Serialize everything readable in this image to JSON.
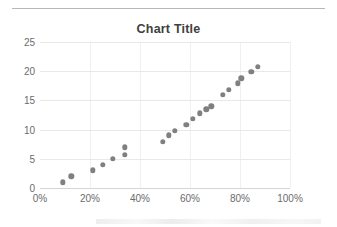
{
  "chart_data": {
    "type": "scatter",
    "title": "Chart Title",
    "xlabel": "",
    "ylabel": "",
    "xlim": [
      0,
      100
    ],
    "ylim": [
      0,
      25
    ],
    "x_tick_labels": [
      "0%",
      "20%",
      "40%",
      "60%",
      "80%",
      "100%"
    ],
    "x_tick_values": [
      0,
      20,
      40,
      60,
      80,
      100
    ],
    "y_tick_labels": [
      "0",
      "5",
      "10",
      "15",
      "20",
      "25"
    ],
    "y_tick_values": [
      0,
      5,
      10,
      15,
      20,
      25
    ],
    "grid": "horizontal",
    "legend": "none",
    "marker_color": "#808080",
    "series": [
      {
        "name": "Series 1",
        "points": [
          [
            9,
            1
          ],
          [
            12.5,
            2
          ],
          [
            21,
            3
          ],
          [
            25,
            4
          ],
          [
            29,
            5
          ],
          [
            34,
            5.7
          ],
          [
            34,
            7
          ],
          [
            49,
            7.9
          ],
          [
            51.5,
            9
          ],
          [
            54,
            9.8
          ],
          [
            58.5,
            10.8
          ],
          [
            61,
            11.9
          ],
          [
            64,
            12.8
          ],
          [
            66.5,
            13.5
          ],
          [
            68.5,
            14
          ],
          [
            73,
            16
          ],
          [
            75.5,
            16.8
          ],
          [
            79,
            17.9
          ],
          [
            80.5,
            18.8
          ],
          [
            84.5,
            19.9
          ],
          [
            87,
            20.8
          ]
        ]
      }
    ]
  },
  "colors": {
    "marker": "#808080",
    "gridline": "#e8e8e8",
    "axis_text": "#6b6b6b",
    "title_text": "#404040",
    "rule": "#b7b7b7"
  }
}
